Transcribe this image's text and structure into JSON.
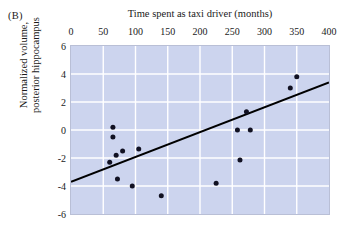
{
  "panel": {
    "label": "(B)"
  },
  "colors": {
    "plot_background": "#ccd4ee",
    "gridline": "#ffffff",
    "frame_border": "#b9bfd6",
    "point_fill": "#111122",
    "trendline": "#000000",
    "text": "#1a1a1a",
    "page_background": "#ffffff"
  },
  "chart_data": {
    "type": "scatter",
    "title": "Time spent as taxi driver (months)",
    "xlabel": "Time spent as taxi driver (months)",
    "ylabel": "Normalized volume, posterior hippocampus",
    "ylabel_line1": "Normalized volume,",
    "ylabel_line2": "posterior hippocampus",
    "xlim": [
      0,
      400
    ],
    "ylim": [
      -6,
      6
    ],
    "xticks": [
      0,
      50,
      100,
      150,
      200,
      250,
      300,
      350,
      400
    ],
    "xtick_labels": [
      "0",
      "50",
      "100",
      "150",
      "200",
      "250",
      "300",
      "350",
      "400"
    ],
    "yticks": [
      6,
      4,
      2,
      0,
      -2,
      -4,
      -6
    ],
    "ytick_labels": [
      "6",
      "4",
      "2",
      "0",
      "-2",
      "-4",
      "-6"
    ],
    "x_axis_position": "top",
    "y_axis_position": "left",
    "grid": true,
    "grid_axis": "both",
    "legend": false,
    "legend_position": "none",
    "points": [
      {
        "x": 60,
        "y": -2.3
      },
      {
        "x": 65,
        "y": 0.2
      },
      {
        "x": 65,
        "y": -0.5
      },
      {
        "x": 70,
        "y": -1.8
      },
      {
        "x": 72,
        "y": -3.5
      },
      {
        "x": 80,
        "y": -1.5
      },
      {
        "x": 95,
        "y": -4.0
      },
      {
        "x": 105,
        "y": -1.35
      },
      {
        "x": 140,
        "y": -4.7
      },
      {
        "x": 225,
        "y": -3.8
      },
      {
        "x": 258,
        "y": 0.0
      },
      {
        "x": 262,
        "y": -2.15
      },
      {
        "x": 272,
        "y": 1.3
      },
      {
        "x": 278,
        "y": 0.0
      },
      {
        "x": 340,
        "y": 3.0
      },
      {
        "x": 350,
        "y": 3.8
      }
    ],
    "trendline": {
      "x_start": 0,
      "y_start": -3.7,
      "x_end": 400,
      "y_end": 3.4
    }
  }
}
